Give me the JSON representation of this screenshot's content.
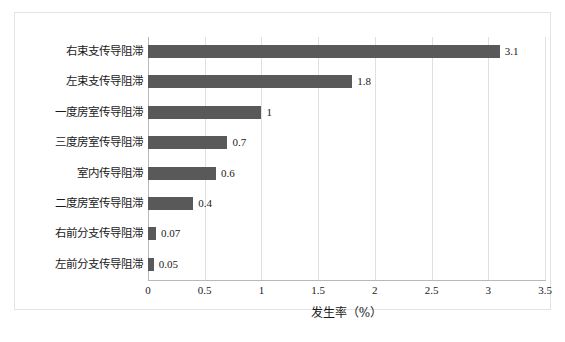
{
  "chart_data": {
    "type": "bar",
    "orientation": "horizontal",
    "title": "",
    "xlabel": "发生率（%）",
    "ylabel": "",
    "xlim": [
      0,
      3.5
    ],
    "xticks": [
      "0",
      "0.5",
      "1",
      "1.5",
      "2",
      "2.5",
      "3",
      "3.5"
    ],
    "xtick_values": [
      0,
      0.5,
      1,
      1.5,
      2,
      2.5,
      3,
      3.5
    ],
    "grid": "vertical",
    "legend": "none",
    "bar_color": "#595959",
    "categories": [
      "右束支传导阻滞",
      "左束支传导阻滞",
      "一度房室传导阻滞",
      "三度房室传导阻滞",
      "室内传导阻滞",
      "二度房室传导阻滞",
      "右前分支传导阻滞",
      "左前分支传导阻滞"
    ],
    "values": [
      3.1,
      1.8,
      1,
      0.7,
      0.6,
      0.4,
      0.07,
      0.05
    ],
    "value_labels": [
      "3.1",
      "1.8",
      "1",
      "0.7",
      "0.6",
      "0.4",
      "0.07",
      "0.05"
    ]
  },
  "figure": {
    "caption": ""
  }
}
